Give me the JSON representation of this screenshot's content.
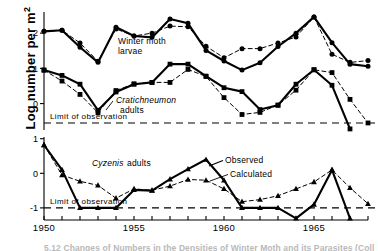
{
  "figure": {
    "y_axis_label_main": "Log number per m",
    "y_axis_label_exp": "2",
    "limit_text_upper": "Limit of observation",
    "limit_text_lower": "Limit of observation",
    "caption_partial": "5.12  Changes of Numbers in the Densities of Winter Moth and its Parasites (Coll"
  },
  "annotations": {
    "winter_moth_line1": "Winter moth",
    "winter_moth_line2": "larvae",
    "cratichneumon_genus": "Cratichneumon",
    "cratichneumon_line2": "adults",
    "cyzenis_genus": "Cyzenis",
    "cyzenis_rest": "adults",
    "observed": "Observed",
    "calculated": "Calculated"
  },
  "colors": {
    "ink": "#000000",
    "background": "#ffffff",
    "caption_ghost": "#b9b9b9"
  },
  "chart_data": {
    "type": "line",
    "title": "",
    "xlabel": "",
    "ylabel": "Log number per m2",
    "grid": false,
    "legend_position": "inline-annotations",
    "x_ticks_labeled": [
      1950,
      1955,
      1960,
      1965
    ],
    "x_ticks_all": [
      1950,
      1951,
      1952,
      1953,
      1954,
      1955,
      1956,
      1957,
      1958,
      1959,
      1960,
      1961,
      1962,
      1963,
      1964,
      1965,
      1966,
      1967,
      1968
    ],
    "panels": [
      {
        "id": "upper",
        "ylim": [
          -0.75,
          2.6
        ],
        "y_ticks": [
          0,
          1,
          2
        ],
        "limit_of_observation": -0.55,
        "series": [
          {
            "name": "Winter moth larvae observed",
            "style": "solid",
            "marker": "circle",
            "x": [
              1950,
              1951,
              1952,
              1953,
              1954,
              1955,
              1956,
              1957,
              1958,
              1959,
              1960,
              1961,
              1962,
              1963,
              1964,
              1965,
              1966,
              1967,
              1968
            ],
            "values": [
              2.05,
              2.08,
              1.6,
              1.17,
              2.17,
              1.92,
              1.88,
              2.4,
              2.28,
              1.51,
              1.21,
              0.95,
              1.16,
              1.62,
              2.0,
              2.46,
              1.73,
              1.12,
              1.06
            ]
          },
          {
            "name": "Winter moth larvae calculated",
            "style": "dashed",
            "marker": "circle",
            "x": [
              1950,
              1951,
              1952,
              1953,
              1954,
              1955,
              1956,
              1957,
              1958,
              1959,
              1960,
              1961,
              1962,
              1963,
              1964,
              1965,
              1966,
              1967,
              1968
            ],
            "values": [
              2.05,
              2.08,
              1.72,
              1.2,
              2.12,
              1.92,
              2.0,
              2.2,
              2.18,
              1.63,
              1.3,
              1.56,
              1.56,
              1.72,
              1.89,
              2.46,
              1.4,
              1.17,
              1.22
            ]
          },
          {
            "name": "Cratichneumon adults observed",
            "style": "solid",
            "marker": "square",
            "x": [
              1950,
              1951,
              1952,
              1953,
              1954,
              1955,
              1956,
              1957,
              1958,
              1959,
              1960,
              1961,
              1962,
              1963,
              1964,
              1965,
              1966,
              1967
            ],
            "values": [
              0.95,
              0.8,
              0.55,
              -0.19,
              0.33,
              0.55,
              0.6,
              1.12,
              1.12,
              0.78,
              0.45,
              0.34,
              -0.17,
              -0.05,
              0.55,
              0.96,
              0.52,
              -0.72
            ]
          },
          {
            "name": "Cratichneumon adults calculated",
            "style": "dashed",
            "marker": "square",
            "x": [
              1950,
              1951,
              1952,
              1953,
              1954,
              1955,
              1956,
              1957,
              1958,
              1959,
              1960,
              1961,
              1962,
              1963,
              1964,
              1965,
              1966,
              1967,
              1968
            ],
            "values": [
              0.95,
              0.64,
              0.26,
              -0.26,
              0.37,
              0.56,
              0.6,
              0.6,
              0.97,
              0.77,
              0.17,
              -0.31,
              -0.25,
              -0.04,
              0.38,
              0.96,
              0.88,
              0.12,
              -0.55
            ]
          }
        ]
      },
      {
        "id": "lower",
        "ylim": [
          -1.35,
          1.05
        ],
        "y_ticks": [
          -1,
          0,
          1
        ],
        "limit_of_observation": -1,
        "series": [
          {
            "name": "Cyzenis adults observed",
            "style": "solid",
            "marker": "triangle",
            "x": [
              1950,
              1951,
              1952,
              1953,
              1954,
              1955,
              1956,
              1957,
              1958,
              1959,
              1960,
              1961,
              1962,
              1963,
              1964,
              1965,
              1966,
              1967,
              1968
            ],
            "values": [
              0.82,
              0.1,
              -1.0,
              -1.0,
              -1.0,
              -0.48,
              -0.5,
              -0.17,
              0.12,
              0.4,
              -0.2,
              -1.0,
              -1.0,
              -1.0,
              -1.3,
              -0.9,
              0.1,
              -1.3,
              null
            ]
          },
          {
            "name": "Cyzenis adults calculated",
            "style": "dashed",
            "marker": "triangle",
            "x": [
              1950,
              1951,
              1952,
              1953,
              1954,
              1955,
              1956,
              1957,
              1958,
              1959,
              1960,
              1961,
              1962,
              1963,
              1964,
              1965,
              1966,
              1967,
              1968
            ],
            "values": [
              0.82,
              -0.05,
              -0.23,
              -0.35,
              -0.72,
              -0.45,
              -0.49,
              -0.37,
              -0.18,
              -0.2,
              -0.45,
              -0.82,
              -0.76,
              -0.65,
              -0.45,
              -0.25,
              0.1,
              -0.42,
              -0.88
            ]
          }
        ]
      }
    ]
  }
}
